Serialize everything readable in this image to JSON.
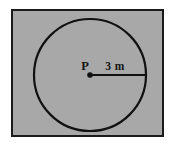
{
  "figure": {
    "kind": "geometry-diagram",
    "frame": {
      "fill_color": "#a8a8a8",
      "border_color": "#1a1a1a",
      "border_width": 2,
      "x": 11,
      "y": 9,
      "width": 153,
      "height": 128
    },
    "circle": {
      "center_x": 90,
      "center_y": 75,
      "radius": 56,
      "stroke_color": "#111111",
      "stroke_width": 2,
      "fill": "none"
    },
    "center_point": {
      "label": "P",
      "x": 90,
      "y": 75,
      "dot_radius": 2.6,
      "dot_color": "#111111",
      "label_x": 85,
      "label_y": 70
    },
    "radius_line": {
      "from_x": 90,
      "from_y": 75,
      "to_x": 146,
      "to_y": 75,
      "stroke_color": "#111111",
      "stroke_width": 2,
      "measure_label": "3 m",
      "label_x": 104,
      "label_y": 70
    }
  }
}
